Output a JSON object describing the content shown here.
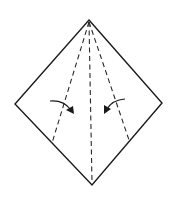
{
  "diagram": {
    "type": "origami-fold-step",
    "caption": "",
    "colors": {
      "outline": "#1a1a1a",
      "fold_line": "#2a2a2a",
      "background": "#ffffff"
    },
    "shape": {
      "name": "kite-square",
      "vertices": {
        "top": [
          89,
          20
        ],
        "left": [
          15,
          104
        ],
        "right": [
          162,
          103
        ],
        "bottom": [
          92,
          185
        ]
      }
    },
    "fold_lines": [
      {
        "name": "left-valley-fold",
        "style": "dashed",
        "from": [
          89,
          22
        ],
        "to": [
          52,
          143
        ]
      },
      {
        "name": "center-valley-fold",
        "style": "dashed",
        "from": [
          89,
          22
        ],
        "to": [
          92,
          183
        ]
      },
      {
        "name": "right-valley-fold",
        "style": "dashed",
        "from": [
          89,
          22
        ],
        "to": [
          129,
          140
        ]
      }
    ],
    "arrows": [
      {
        "name": "fold-left-edge-in",
        "direction": "right-down",
        "from": [
          50,
          101
        ],
        "to": [
          73,
          113
        ]
      },
      {
        "name": "fold-right-edge-in",
        "direction": "left-down",
        "from": [
          125,
          99
        ],
        "to": [
          105,
          113
        ]
      }
    ]
  }
}
